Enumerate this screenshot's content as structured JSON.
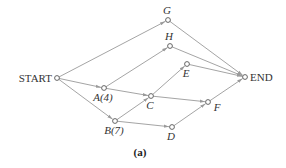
{
  "diagram": {
    "type": "activity-network",
    "caption": "(a)",
    "nodes": [
      {
        "id": "START",
        "label": "START",
        "x": 57,
        "y": 78,
        "label_pos": "left",
        "italic": false
      },
      {
        "id": "G",
        "label": "G",
        "x": 168,
        "y": 20,
        "label_pos": "above",
        "italic": true
      },
      {
        "id": "H",
        "label": "H",
        "x": 170,
        "y": 46,
        "label_pos": "above",
        "italic": true
      },
      {
        "id": "E",
        "label": "E",
        "x": 187,
        "y": 64,
        "label_pos": "below",
        "italic": true
      },
      {
        "id": "A",
        "label": "A(4)",
        "x": 104,
        "y": 88,
        "label_pos": "below",
        "italic": true
      },
      {
        "id": "C",
        "label": "C",
        "x": 151,
        "y": 96,
        "label_pos": "below",
        "italic": true
      },
      {
        "id": "F",
        "label": "F",
        "x": 208,
        "y": 102,
        "label_pos": "below-right",
        "italic": true
      },
      {
        "id": "B",
        "label": "B(7)",
        "x": 115,
        "y": 121,
        "label_pos": "below",
        "italic": true
      },
      {
        "id": "D",
        "label": "D",
        "x": 172,
        "y": 127,
        "label_pos": "below",
        "italic": true
      },
      {
        "id": "END",
        "label": "END",
        "x": 245,
        "y": 77,
        "label_pos": "right",
        "italic": false
      }
    ],
    "edges": [
      {
        "from": "START",
        "to": "G"
      },
      {
        "from": "START",
        "to": "A"
      },
      {
        "from": "START",
        "to": "B"
      },
      {
        "from": "A",
        "to": "H"
      },
      {
        "from": "A",
        "to": "C"
      },
      {
        "from": "B",
        "to": "C"
      },
      {
        "from": "B",
        "to": "D"
      },
      {
        "from": "C",
        "to": "E"
      },
      {
        "from": "C",
        "to": "F"
      },
      {
        "from": "D",
        "to": "F"
      },
      {
        "from": "G",
        "to": "END"
      },
      {
        "from": "H",
        "to": "END"
      },
      {
        "from": "E",
        "to": "END"
      },
      {
        "from": "F",
        "to": "END"
      }
    ]
  },
  "colors": {
    "edge": "#9a9a9a",
    "node_stroke": "#555555",
    "text": "#333333"
  }
}
